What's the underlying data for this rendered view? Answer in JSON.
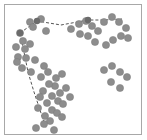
{
  "figure": {
    "title": "",
    "frame_color": "#a8a8a8",
    "background_color": "#ffffff",
    "width": 147,
    "height": 140
  },
  "chart_data": {
    "type": "scatter",
    "title": "",
    "subtitle": "",
    "xlabel": "",
    "ylabel": "",
    "grid": false,
    "legend": null,
    "axis_ticks": [],
    "tick_labels": [],
    "annotations": [],
    "xlim": [
      0,
      147
    ],
    "ylim": [
      0,
      140
    ],
    "point_style": {
      "marker": "circle",
      "fill_color": "#8d8d8d",
      "edge_color": "#7a7a7a",
      "radius": 3.6,
      "count": 62
    },
    "series": [
      {
        "name": "points",
        "marker": "circle",
        "color": "#8d8d8d",
        "x": [
          20,
          30,
          41,
          46,
          33,
          23,
          16,
          18,
          25,
          30,
          17,
          26,
          22,
          31,
          35,
          44,
          41,
          48,
          56,
          62,
          55,
          49,
          43,
          52,
          60,
          66,
          58,
          47,
          40,
          52,
          63,
          70,
          45,
          38,
          57,
          50,
          44,
          62,
          36,
          54,
          71,
          79,
          86,
          92,
          98,
          88,
          80,
          95,
          104,
          112,
          119,
          126,
          121,
          113,
          106,
          128,
          104,
          112,
          120,
          127,
          111,
          120
        ],
        "y": [
          33,
          22,
          19,
          31,
          27,
          41,
          47,
          57,
          49,
          44,
          62,
          58,
          68,
          72,
          60,
          66,
          77,
          72,
          78,
          74,
          86,
          84,
          91,
          96,
          93,
          88,
          101,
          103,
          97,
          110,
          104,
          97,
          116,
          108,
          113,
          121,
          124,
          117,
          128,
          130,
          29,
          24,
          21,
          26,
          31,
          36,
          34,
          42,
          22,
          17,
          22,
          28,
          36,
          40,
          45,
          38,
          70,
          66,
          72,
          77,
          82,
          88
        ]
      }
    ],
    "path": {
      "name": "dashed-boundary-path",
      "style": "dashed",
      "color": "#555555",
      "width": 1,
      "vertices": [
        [
          20,
          33
        ],
        [
          37,
          21
        ],
        [
          61,
          25
        ],
        [
          88,
          20
        ],
        [
          104,
          20
        ],
        [
          122,
          19
        ]
      ],
      "branch_vertices": [
        [
          20,
          33
        ],
        [
          24,
          52
        ],
        [
          28,
          72
        ],
        [
          34,
          92
        ],
        [
          40,
          110
        ],
        [
          46,
          128
        ]
      ],
      "node_marker": {
        "shape": "circle",
        "color": "#6b6b6b",
        "radius": 3.2,
        "positions": [
          [
            20,
            33
          ],
          [
            37,
            21
          ],
          [
            88,
            20
          ]
        ]
      }
    }
  }
}
